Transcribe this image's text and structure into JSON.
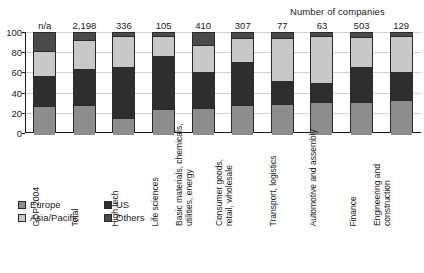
{
  "annotation": "Number of companies",
  "legend": {
    "position": "below-axis",
    "entries": [
      {
        "label": "Europe",
        "color": "#8d8d8d",
        "icon": "legend-swatch"
      },
      {
        "label": "US",
        "color": "#2e2e2e",
        "icon": "legend-swatch"
      },
      {
        "label": "Asia/Pacific",
        "color": "#c8c8c8",
        "icon": "legend-swatch"
      },
      {
        "label": "Others",
        "color": "#4a4a4a",
        "icon": "legend-swatch"
      }
    ]
  },
  "axis": {
    "yticks": [
      "100",
      "80",
      "60",
      "40",
      "20",
      "0"
    ],
    "ylim": [
      0,
      100
    ],
    "grid": true
  },
  "chart_data": {
    "type": "bar",
    "subtype": "stacked-100-percent",
    "title": "",
    "subtitle": "",
    "xlabel": "",
    "ylabel": "",
    "ylim": [
      0,
      100
    ],
    "yticks": [
      0,
      20,
      40,
      60,
      80,
      100
    ],
    "grid": true,
    "legend_position": "below-axis",
    "annotation": "Number of companies",
    "categories": [
      "GDP 2004",
      "Total",
      "High tech",
      "Life sciences",
      "Basic materials, chemicals, utilities, energy",
      "Consumer goods, retail, wholesale",
      "Transport, logistics",
      "Automotive and assembly",
      "Finance",
      "Engineering and construction"
    ],
    "category_lines": [
      [
        "GDP 2004"
      ],
      [
        "Total"
      ],
      [
        "High tech"
      ],
      [
        "Life sciences"
      ],
      [
        "Basic materials, chemicals,",
        "utilities, energy"
      ],
      [
        "Consumer goods,",
        "retail, wholesale"
      ],
      [
        "Transport, logistics"
      ],
      [
        "Automotive and assembly"
      ],
      [
        "Finance"
      ],
      [
        "Engineering and",
        "construction"
      ]
    ],
    "number_of_companies": [
      "n/a",
      "2,198",
      "336",
      "105",
      "410",
      "307",
      "77",
      "63",
      "503",
      "129"
    ],
    "series": [
      {
        "name": "Europe",
        "color": "#8d8d8d",
        "values": [
          28,
          29,
          16,
          25,
          26,
          29,
          30,
          32,
          32,
          34
        ]
      },
      {
        "name": "US",
        "color": "#2e2e2e",
        "values": [
          30,
          36,
          51,
          53,
          36,
          43,
          23,
          18,
          35,
          28
        ]
      },
      {
        "name": "Asia/Pacific",
        "color": "#c8c8c8",
        "values": [
          24,
          28,
          30,
          19,
          26,
          23,
          42,
          47,
          29,
          35
        ]
      },
      {
        "name": "Others",
        "color": "#4a4a4a",
        "values": [
          18,
          7,
          3,
          3,
          12,
          5,
          5,
          3,
          4,
          3
        ]
      }
    ]
  }
}
